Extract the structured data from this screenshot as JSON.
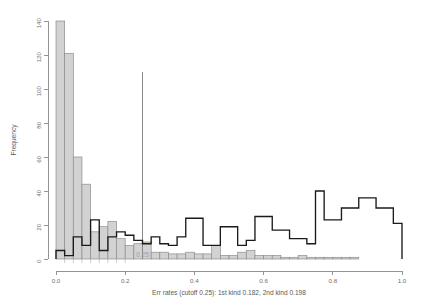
{
  "chart_data": {
    "type": "bar",
    "title": "",
    "subtitle": "",
    "xlabel": "Err rates (cutoff 0.25): 1st kind 0.182, 2nd kind 0.198",
    "ylabel": "Frequency",
    "xlim": [
      0.0,
      1.0
    ],
    "ylim": [
      0,
      140
    ],
    "grid": false,
    "legend_position": "none",
    "bin_width": 0.025,
    "bin_edges": [
      0.0,
      0.025,
      0.05,
      0.075,
      0.1,
      0.125,
      0.15,
      0.175,
      0.2,
      0.225,
      0.25,
      0.275,
      0.3,
      0.325,
      0.35,
      0.375,
      0.4,
      0.425,
      0.45,
      0.475,
      0.5,
      0.525,
      0.55,
      0.575,
      0.6,
      0.625,
      0.65,
      0.675,
      0.7,
      0.725,
      0.75,
      0.775,
      0.8,
      0.825,
      0.85,
      0.875,
      0.9,
      0.925,
      0.95,
      0.975,
      1.0
    ],
    "xticks": [
      0.0,
      0.2,
      0.4,
      0.6,
      0.8,
      1.0
    ],
    "xtick_labels": [
      "0.0",
      "0.2",
      "0.4",
      "0.6",
      "0.8",
      "1.0"
    ],
    "yticks": [
      0,
      20,
      40,
      60,
      80,
      100,
      120,
      140
    ],
    "ytick_labels": [
      "0",
      "20",
      "40",
      "60",
      "80",
      "100",
      "120",
      "140"
    ],
    "series": [
      {
        "name": "null-distribution",
        "style": "filled-grey-bars",
        "fill_color": "#d2d2d2",
        "stroke_color": "#8e8e8e",
        "values": [
          140,
          121,
          60,
          44,
          16,
          19,
          22,
          12,
          8,
          9,
          10,
          4,
          4,
          3,
          3,
          4,
          3,
          3,
          8,
          2,
          2,
          4,
          5,
          2,
          2,
          2,
          1,
          1,
          2,
          1,
          1,
          1,
          1,
          1,
          1,
          0,
          0,
          0,
          0,
          0
        ]
      },
      {
        "name": "alternative-distribution",
        "style": "black-outline-steps",
        "stroke_color": "#1a1a1a",
        "values": [
          5,
          2,
          13,
          8,
          23,
          5,
          13,
          16,
          14,
          11,
          9,
          13,
          9,
          8,
          13,
          24,
          24,
          8,
          8,
          19,
          19,
          8,
          11,
          25,
          25,
          17,
          17,
          12,
          12,
          9,
          40,
          23,
          23,
          30,
          30,
          36,
          36,
          30,
          30,
          21
        ]
      }
    ],
    "annotations": [
      {
        "name": "cutoff-line",
        "type": "vline",
        "x": 0.25,
        "y_top": 110,
        "label": "0.25",
        "color": "#8a8a8a"
      }
    ]
  },
  "axis": {
    "y_title": "Frequency",
    "x_caption": "Err rates (cutoff 0.25): 1st kind 0.182, 2nd kind 0.198"
  },
  "ticks": {
    "y": [
      "140",
      "120",
      "100",
      "80",
      "60",
      "40",
      "20",
      "0"
    ],
    "x": [
      "0.0",
      "0.2",
      "0.4",
      "0.6",
      "0.8",
      "1.0"
    ]
  },
  "cutoff": {
    "label": "0.25"
  }
}
